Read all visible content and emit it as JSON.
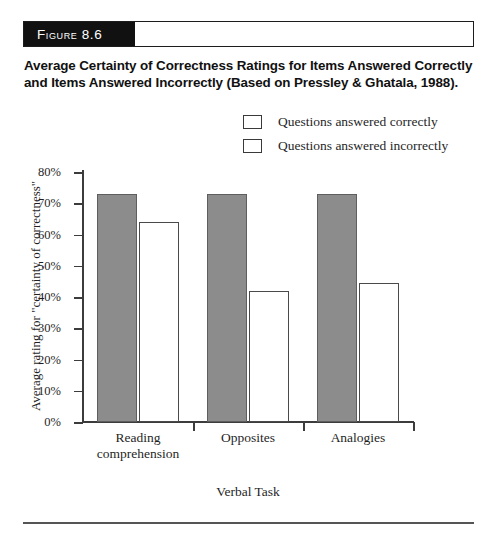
{
  "figure": {
    "tag_prefix": "F",
    "tag_rest": "IGURE",
    "tag_number": "8.6",
    "tag_full": "Figure 8.6",
    "caption": "Average Certainty of Correctness Ratings for Items Answered Correctly and Items Answered Incorrectly (Based on Pressley & Ghatala, 1988)."
  },
  "legend": {
    "position": "top-right",
    "entries": [
      {
        "label": "Questions answered correctly",
        "color": "#8c8c8c"
      },
      {
        "label": "Questions answered incorrectly",
        "color": "#ffffff"
      }
    ]
  },
  "chart_data": {
    "type": "bar",
    "title": "Average Certainty of Correctness Ratings for Items Answered Correctly and Items Answered Incorrectly (Based on Pressley & Ghatala, 1988).",
    "categories": [
      "Reading comprehension",
      "Opposites",
      "Analogies"
    ],
    "category_lines": [
      [
        "Reading",
        "comprehension"
      ],
      [
        "Opposites"
      ],
      [
        "Analogies"
      ]
    ],
    "series": [
      {
        "name": "Questions answered correctly",
        "color": "#8c8c8c",
        "values": [
          73,
          73,
          73
        ]
      },
      {
        "name": "Questions answered incorrectly",
        "color": "#ffffff",
        "values": [
          64,
          42,
          44.5
        ]
      }
    ],
    "xlabel": "Verbal Task",
    "ylabel": "Average rating for \"certainty of correctness\"",
    "ylim": [
      0,
      80
    ],
    "ytick_values": [
      0,
      10,
      20,
      30,
      40,
      50,
      60,
      70,
      80
    ],
    "ytick_labels": [
      "0%",
      "10%",
      "20%",
      "30%",
      "40%",
      "50%",
      "60%",
      "70%",
      "80%"
    ],
    "grid": false,
    "value_suffix": "%"
  }
}
